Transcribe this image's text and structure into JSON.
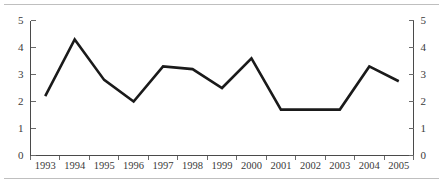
{
  "chart_data": {
    "type": "line",
    "title": "",
    "subtitle": "",
    "xlabel": "",
    "ylabel": "",
    "categories": [
      "1993",
      "1994",
      "1995",
      "1996",
      "1997",
      "1998",
      "1999",
      "2000",
      "2001",
      "2002",
      "2003",
      "2004",
      "2005"
    ],
    "values": [
      2.2,
      4.3,
      2.8,
      2.0,
      3.3,
      3.2,
      2.5,
      3.6,
      1.7,
      1.7,
      1.7,
      3.3,
      2.75
    ],
    "series": [
      {
        "name": "",
        "values": [
          2.2,
          4.3,
          2.8,
          2.0,
          3.3,
          3.2,
          2.5,
          3.6,
          1.7,
          1.7,
          1.7,
          3.3,
          2.75
        ]
      }
    ],
    "ylim": [
      0,
      5
    ],
    "yticks": [
      0,
      1,
      2,
      3,
      4,
      5
    ],
    "ytick_labels_left": [
      "0",
      "1",
      "2",
      "3",
      "4",
      "5"
    ],
    "ytick_labels_right": [
      "0",
      "1",
      "2",
      "3",
      "4",
      "5"
    ],
    "xtick_labels": [
      "1993",
      "1994",
      "1995",
      "1996",
      "1997",
      "1998",
      "1999",
      "2000",
      "2001",
      "2002",
      "2003",
      "2004",
      "2005"
    ],
    "grid": false,
    "legend": null,
    "legend_position": "none",
    "dual_y_axis": true,
    "line_color": "#1a1a1a",
    "axis_color": "#4a4a4a",
    "annotations": []
  }
}
